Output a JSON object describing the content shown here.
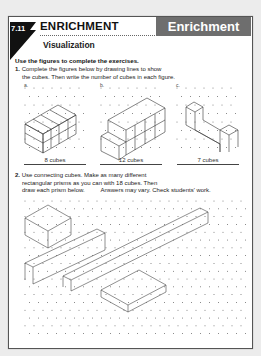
{
  "header": {
    "lesson_number": "7.11",
    "title": "ENRICHMENT",
    "subtitle": "Visualization",
    "banner": "Enrichment"
  },
  "instructions": "Use the figures to complete the exercises.",
  "exercise1": {
    "number": "1.",
    "text_line1": "Complete the figures below by drawing lines to show",
    "text_line2": "the cubes. Then write the number of cubes in each figure.",
    "figures": [
      {
        "label": "a.",
        "answer": "8 cubes"
      },
      {
        "label": "b.",
        "answer": "12 cubes"
      },
      {
        "label": "c.",
        "answer": "7 cubes"
      }
    ]
  },
  "exercise2": {
    "number": "2.",
    "text_line1": "Use connecting cubes. Make as many different",
    "text_line2": "rectangular prisms as you can with 18 cubes. Then",
    "text_line3": "draw each prism below.",
    "answer_note": "Answers may vary. Check students' work."
  }
}
